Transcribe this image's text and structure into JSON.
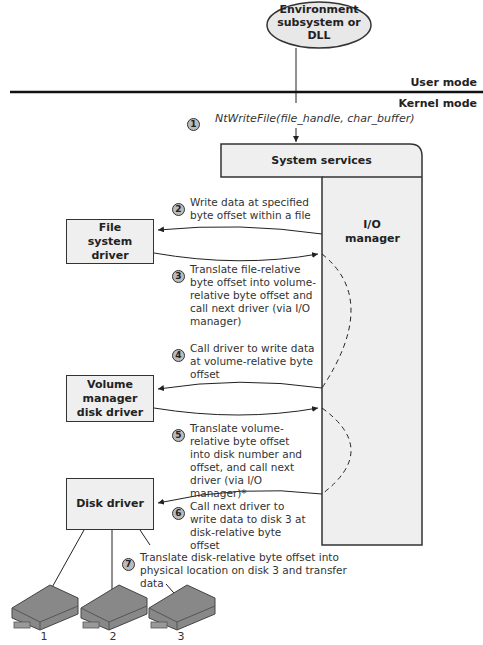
{
  "environment": {
    "label": "Environment subsystem or DLL"
  },
  "modes": {
    "user": "User mode",
    "kernel": "Kernel mode"
  },
  "call": {
    "step": "1",
    "text": "NtWriteFile(file_handle, char_buffer)"
  },
  "system_services": {
    "label": "System services"
  },
  "io_manager": {
    "label": "I/O manager"
  },
  "drivers": {
    "file_system": "File system driver",
    "volume_manager": "Volume manager disk driver",
    "disk": "Disk driver"
  },
  "steps": [
    {
      "num": "2",
      "text": "Write data at specified byte offset within a file"
    },
    {
      "num": "3",
      "text": "Translate file-relative byte offset into volume-relative byte offset and call next driver (via I/O manager)"
    },
    {
      "num": "4",
      "text": "Call driver to write data at volume-relative byte offset"
    },
    {
      "num": "5",
      "text": "Translate volume-relative byte offset into disk number and offset, and call next driver (via I/O manager)*"
    },
    {
      "num": "6",
      "text": "Call next driver to write data to disk 3 at disk-relative byte offset"
    },
    {
      "num": "7",
      "text": "Translate disk-relative byte offset into physical location on disk 3 and transfer data"
    }
  ],
  "disks": [
    "1",
    "2",
    "3"
  ]
}
